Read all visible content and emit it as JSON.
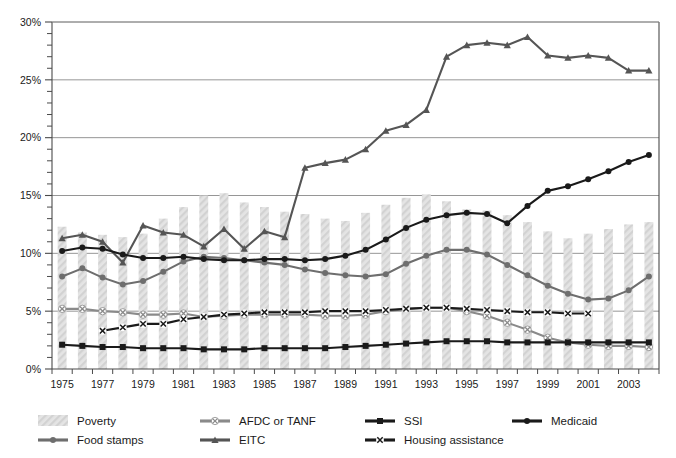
{
  "chart_data": {
    "type": "line",
    "title": "",
    "subtitle": "",
    "xlabel": "",
    "ylabel": "",
    "xlim": [
      1975,
      2004
    ],
    "ylim": [
      0,
      30
    ],
    "y_tick_format": "percent",
    "y_major_ticks": [
      "0%",
      "5%",
      "10%",
      "15%",
      "20%",
      "25%",
      "30%"
    ],
    "y_major_values": [
      0,
      5,
      10,
      15,
      20,
      25,
      30
    ],
    "y_minor_interval": 1,
    "grid": "horizontal-major",
    "legend_position": "bottom",
    "x": [
      1975,
      1976,
      1977,
      1978,
      1979,
      1980,
      1981,
      1982,
      1983,
      1984,
      1985,
      1986,
      1987,
      1988,
      1989,
      1990,
      1991,
      1992,
      1993,
      1994,
      1995,
      1996,
      1997,
      1998,
      1999,
      2000,
      2001,
      2002,
      2003,
      2004
    ],
    "x_tick_labels": [
      "1975",
      "1977",
      "1979",
      "1981",
      "1983",
      "1985",
      "1987",
      "1989",
      "1991",
      "1993",
      "1995",
      "1997",
      "1999",
      "2001",
      "2003"
    ],
    "x_tick_values": [
      1975,
      1977,
      1979,
      1981,
      1983,
      1985,
      1987,
      1989,
      1991,
      1993,
      1995,
      1997,
      1999,
      2001,
      2003
    ],
    "series": [
      {
        "name": "Poverty",
        "style": "bar",
        "color": "#dcdcdc",
        "marker": "none",
        "values": [
          12.3,
          11.8,
          11.6,
          11.4,
          11.7,
          13.0,
          14.0,
          15.0,
          15.2,
          14.4,
          14.0,
          13.6,
          13.4,
          13.0,
          12.8,
          13.5,
          14.2,
          14.8,
          15.1,
          14.5,
          13.8,
          13.7,
          13.3,
          12.7,
          11.9,
          11.3,
          11.7,
          12.1,
          12.5,
          12.7
        ]
      },
      {
        "name": "Food stamps",
        "style": "line",
        "color": "#6e6e6e",
        "marker": "circle",
        "values": [
          8.0,
          8.7,
          7.9,
          7.3,
          7.6,
          8.4,
          9.3,
          9.7,
          9.6,
          9.4,
          9.2,
          9.0,
          8.6,
          8.3,
          8.1,
          8.0,
          8.2,
          9.1,
          9.8,
          10.3,
          10.3,
          9.9,
          9.0,
          8.1,
          7.2,
          6.5,
          6.0,
          6.1,
          6.8,
          8.0
        ]
      },
      {
        "name": "AFDC or TANF",
        "style": "line",
        "color": "#8a8a8a",
        "marker": "x-circle",
        "values": [
          5.2,
          5.2,
          5.0,
          4.9,
          4.7,
          4.7,
          4.8,
          4.5,
          4.6,
          4.7,
          4.7,
          4.7,
          4.7,
          4.6,
          4.6,
          4.7,
          5.0,
          5.2,
          5.3,
          5.3,
          5.0,
          4.6,
          4.0,
          3.4,
          2.7,
          2.3,
          2.1,
          2.0,
          2.0,
          1.9
        ]
      },
      {
        "name": "EITC",
        "style": "line",
        "color": "#555555",
        "marker": "triangle",
        "values": [
          11.3,
          11.6,
          11.0,
          9.2,
          12.4,
          11.8,
          11.6,
          10.6,
          12.1,
          10.4,
          11.9,
          11.4,
          17.4,
          17.8,
          18.1,
          19.0,
          20.6,
          21.1,
          22.4,
          27.0,
          28.0,
          28.2,
          28.0,
          28.7,
          27.1,
          26.9,
          27.1,
          26.9,
          25.8,
          25.8
        ]
      },
      {
        "name": "SSI",
        "style": "line",
        "color": "#1a1a1a",
        "marker": "square",
        "values": [
          2.1,
          2.0,
          1.9,
          1.9,
          1.8,
          1.8,
          1.8,
          1.7,
          1.7,
          1.7,
          1.8,
          1.8,
          1.8,
          1.8,
          1.9,
          2.0,
          2.1,
          2.2,
          2.3,
          2.4,
          2.4,
          2.4,
          2.3,
          2.3,
          2.3,
          2.3,
          2.3,
          2.3,
          2.3,
          2.3
        ]
      },
      {
        "name": "Housing assistance",
        "style": "line",
        "color": "#1a1a1a",
        "marker": "x-white",
        "values": [
          null,
          null,
          3.3,
          3.6,
          3.9,
          3.9,
          4.3,
          4.5,
          4.7,
          4.8,
          4.9,
          4.9,
          4.9,
          5.0,
          5.0,
          5.0,
          5.1,
          5.2,
          5.3,
          5.3,
          5.2,
          5.1,
          5.0,
          4.9,
          4.9,
          4.8,
          4.8,
          null,
          null,
          null
        ]
      },
      {
        "name": "Medicaid",
        "style": "line",
        "color": "#1a1a1a",
        "marker": "circle",
        "values": [
          10.2,
          10.5,
          10.4,
          9.9,
          9.6,
          9.6,
          9.7,
          9.5,
          9.4,
          9.4,
          9.5,
          9.5,
          9.4,
          9.5,
          9.8,
          10.3,
          11.2,
          12.2,
          12.9,
          13.3,
          13.5,
          13.4,
          12.6,
          14.1,
          15.4,
          15.8,
          16.4,
          17.1,
          17.9,
          18.5
        ]
      }
    ]
  },
  "legend": {
    "items": [
      {
        "label": "Poverty",
        "marker": "bar-swatch",
        "color": "#dcdcdc"
      },
      {
        "label": "AFDC or TANF",
        "marker": "x-circle",
        "color": "#8a8a8a"
      },
      {
        "label": "SSI",
        "marker": "square",
        "color": "#1a1a1a"
      },
      {
        "label": "Medicaid",
        "marker": "circle",
        "color": "#1a1a1a"
      },
      {
        "label": "Food stamps",
        "marker": "circle",
        "color": "#6e6e6e"
      },
      {
        "label": "EITC",
        "marker": "triangle",
        "color": "#555555"
      },
      {
        "label": "Housing assistance",
        "marker": "x-white",
        "color": "#1a1a1a"
      }
    ]
  }
}
